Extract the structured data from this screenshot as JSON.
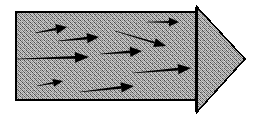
{
  "figure": {
    "background_color": "#ffffff",
    "outline_color": "#000000",
    "fill_color": "#9a9a9a",
    "fill_pattern": "halftone-checkerboard",
    "vector_color": "#000000",
    "canvas": {
      "width": 256,
      "height": 118
    }
  },
  "shapes": {
    "shaft": {
      "name": "arrow-shaft-rectangle",
      "x": 16,
      "y": 12,
      "width": 180,
      "height": 88,
      "stroke_width": 1.6
    },
    "head": {
      "name": "arrow-head-triangle",
      "points": "197,7 245,59 197,112",
      "stroke_width": 1.6
    },
    "neck_line": {
      "name": "arrow-neck-line",
      "x1": 196,
      "y1": 7,
      "x2": 196,
      "y2": 112,
      "stroke_width": 1.6
    }
  },
  "chart_data": {
    "type": "scatter",
    "xlabel": "",
    "ylabel": "",
    "xlim": [
      0,
      256
    ],
    "ylim": [
      0,
      118
    ],
    "grid": false,
    "legend": null,
    "annotations": [],
    "series": [
      {
        "name": "flow-vectors",
        "kind": "arrows",
        "count": 8,
        "values": [
          {
            "id": 1,
            "x1": 35,
            "y1": 33,
            "x2": 67,
            "y2": 27,
            "length": 32.6,
            "angle_deg": 10.6,
            "head_length": 11,
            "head_width": 5.0,
            "tail_width": 1.2
          },
          {
            "id": 2,
            "x1": 58,
            "y1": 41,
            "x2": 99,
            "y2": 37,
            "length": 41.2,
            "angle_deg": 5.6,
            "head_length": 12,
            "head_width": 5.2,
            "tail_width": 1.3
          },
          {
            "id": 3,
            "x1": 147,
            "y1": 22,
            "x2": 179,
            "y2": 22,
            "length": 32.0,
            "angle_deg": 0.0,
            "head_length": 10,
            "head_width": 4.6,
            "tail_width": 1.1
          },
          {
            "id": 4,
            "x1": 115,
            "y1": 31,
            "x2": 166,
            "y2": 46,
            "length": 53.2,
            "angle_deg": -16.4,
            "head_length": 12,
            "head_width": 4.6,
            "tail_width": 1.0
          },
          {
            "id": 5,
            "x1": 17,
            "y1": 59,
            "x2": 89,
            "y2": 57,
            "length": 72.0,
            "angle_deg": 1.6,
            "head_length": 14,
            "head_width": 5.4,
            "tail_width": 1.4
          },
          {
            "id": 6,
            "x1": 100,
            "y1": 54,
            "x2": 142,
            "y2": 51,
            "length": 42.1,
            "angle_deg": 4.1,
            "head_length": 12,
            "head_width": 5.2,
            "tail_width": 1.3
          },
          {
            "id": 7,
            "x1": 133,
            "y1": 73,
            "x2": 191,
            "y2": 68,
            "length": 58.2,
            "angle_deg": 4.9,
            "head_length": 13,
            "head_width": 5.2,
            "tail_width": 1.4
          },
          {
            "id": 8,
            "x1": 37,
            "y1": 86,
            "x2": 63,
            "y2": 81,
            "length": 26.5,
            "angle_deg": 10.9,
            "head_length": 10,
            "head_width": 4.0,
            "tail_width": 1.0
          },
          {
            "id": 9,
            "x1": 80,
            "y1": 92,
            "x2": 134,
            "y2": 86,
            "length": 54.3,
            "angle_deg": 6.3,
            "head_length": 13,
            "head_width": 5.2,
            "tail_width": 1.4
          }
        ]
      }
    ]
  }
}
